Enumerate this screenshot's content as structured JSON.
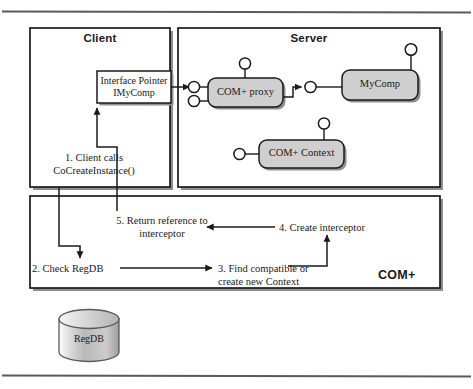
{
  "figure": {
    "rule_color": "#4a4a4a",
    "line_color": "#1a1a1a",
    "box_fill": "#ffffff",
    "component_fill": "#cfcfcf",
    "shadow_color": "#7a7a7a"
  },
  "client_panel": {
    "title": "Client",
    "interface_box": {
      "line1": "Interface Pointer",
      "line2": "IMyComp"
    },
    "step1": {
      "line1": "1. Client calls",
      "line2": "CoCreateInstance()"
    }
  },
  "server_panel": {
    "title": "Server",
    "components": [
      {
        "name": "com-plus-proxy",
        "label": "COM+ proxy"
      },
      {
        "name": "mycomp",
        "label": "MyComp"
      },
      {
        "name": "com-plus-context",
        "label": "COM+ Context"
      }
    ]
  },
  "comp_panel": {
    "title": "COM+",
    "steps": [
      {
        "id": "step5",
        "line1": "5. Return reference to",
        "line2": "interceptor"
      },
      {
        "id": "step4",
        "line1": "4. Create interceptor",
        "line2": ""
      },
      {
        "id": "step2",
        "line1": "2. Check RegDB",
        "line2": ""
      },
      {
        "id": "step3",
        "line1": "3. Find compatible or",
        "line2": "create new Context"
      }
    ]
  },
  "database": {
    "label": "RegDB"
  }
}
